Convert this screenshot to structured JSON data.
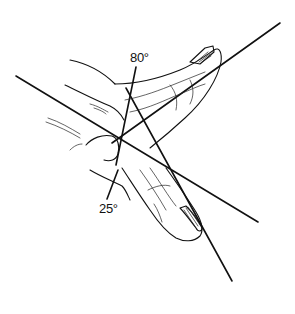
{
  "figure": {
    "angle_labels": [
      {
        "id": "upper-angle",
        "text": "80°"
      },
      {
        "id": "lower-angle",
        "text": "25°"
      }
    ],
    "colors": {
      "ink": "#111111",
      "background": "#ffffff"
    }
  }
}
